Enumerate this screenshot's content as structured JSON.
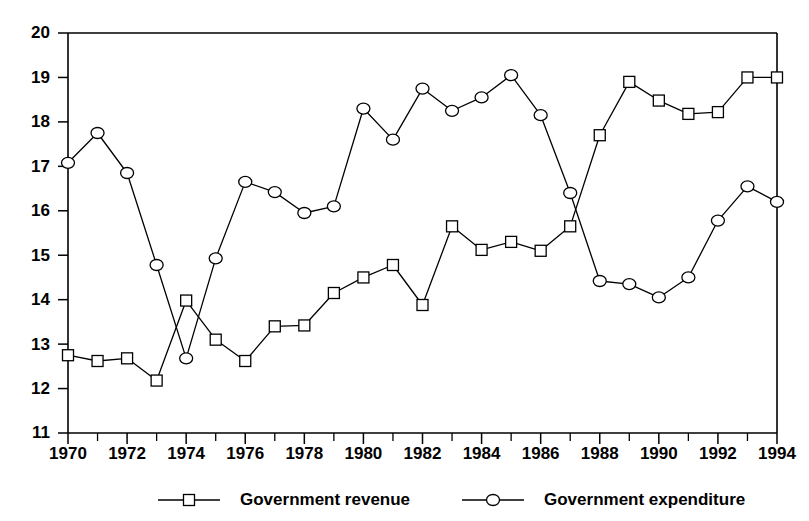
{
  "chart_data": {
    "type": "line",
    "title": "",
    "subtitle": "",
    "xlabel": "",
    "ylabel": "",
    "xlim": [
      1969.5,
      1994.5
    ],
    "ylim": [
      11,
      20
    ],
    "grid": false,
    "legend_position": "bottom",
    "x": [
      1970,
      1971,
      1972,
      1973,
      1974,
      1975,
      1976,
      1977,
      1978,
      1979,
      1980,
      1981,
      1982,
      1983,
      1984,
      1985,
      1986,
      1987,
      1988,
      1989,
      1990,
      1991,
      1992,
      1993,
      1994
    ],
    "x_tick_labels": [
      "1970",
      "1972",
      "1974",
      "1976",
      "1978",
      "1980",
      "1982",
      "1984",
      "1986",
      "1988",
      "1990",
      "1992",
      "1994"
    ],
    "x_tick_values": [
      1970,
      1972,
      1974,
      1976,
      1978,
      1980,
      1982,
      1984,
      1986,
      1988,
      1990,
      1992,
      1994
    ],
    "x_minor_ticks": [
      1971,
      1973,
      1975,
      1977,
      1979,
      1981,
      1983,
      1985,
      1987,
      1989,
      1991,
      1993
    ],
    "y_tick_labels": [
      "11",
      "12",
      "13",
      "14",
      "15",
      "16",
      "17",
      "18",
      "19",
      "20"
    ],
    "y_tick_values": [
      11,
      12,
      13,
      14,
      15,
      16,
      17,
      18,
      19,
      20
    ],
    "series": [
      {
        "name": "Government revenue",
        "marker": "square",
        "values": [
          12.75,
          12.62,
          12.68,
          12.18,
          13.98,
          13.1,
          12.62,
          13.4,
          13.42,
          14.15,
          14.5,
          14.78,
          13.88,
          15.65,
          15.12,
          15.3,
          15.1,
          15.65,
          17.7,
          18.9,
          18.48,
          18.18,
          18.22,
          19.0,
          19.0
        ]
      },
      {
        "name": "Government expenditure",
        "marker": "circle",
        "values": [
          17.08,
          17.75,
          16.85,
          14.78,
          12.68,
          14.93,
          16.65,
          16.42,
          15.95,
          16.1,
          18.3,
          17.6,
          18.75,
          18.25,
          18.55,
          19.05,
          18.15,
          16.4,
          14.42,
          14.35,
          14.05,
          14.5,
          15.78,
          16.55,
          16.2
        ]
      }
    ]
  },
  "legend": {
    "items": [
      {
        "label": "Government revenue",
        "marker": "square"
      },
      {
        "label": "Government expenditure",
        "marker": "circle"
      }
    ]
  },
  "colors": {
    "line": "#000000",
    "marker_fill": "#ffffff",
    "axis": "#000000",
    "background": "#ffffff"
  }
}
